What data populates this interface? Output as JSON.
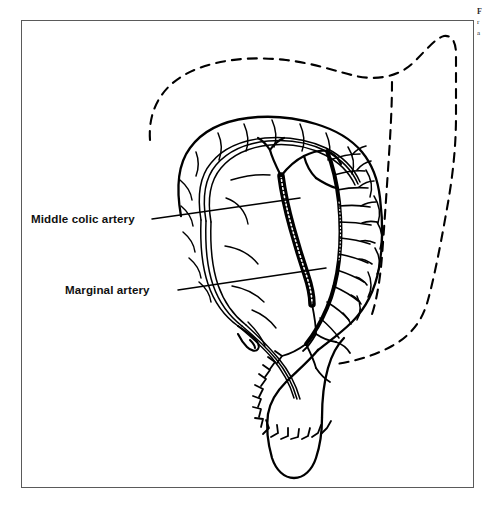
{
  "figure": {
    "type": "anatomical-line-drawing",
    "frame_color": "#5a5a5a",
    "ink_color": "#000000",
    "background_color": "#ffffff"
  },
  "labels": {
    "middle_colic_artery": "Middle colic artery",
    "marginal_artery": "Marginal artery"
  },
  "caption_fragment": {
    "line1": "F",
    "line2": "r",
    "line3": "a"
  },
  "legend": {
    "solid_outline_meaning": "Mobilized colon after resection",
    "dashed_outline_meaning": "Original position of colon"
  }
}
